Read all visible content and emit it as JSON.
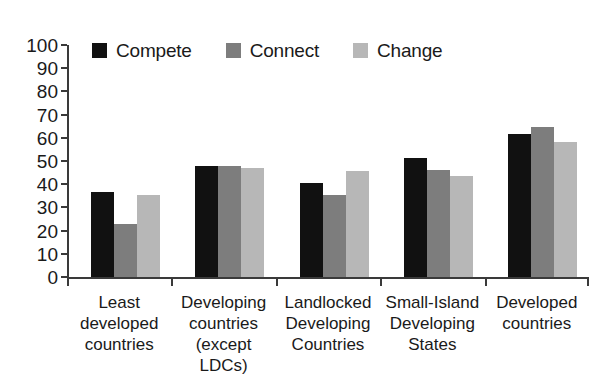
{
  "chart_data": {
    "type": "bar",
    "title": "",
    "xlabel": "",
    "ylabel": "",
    "ylim": [
      0,
      100
    ],
    "yticks": [
      0,
      10,
      20,
      30,
      40,
      50,
      60,
      70,
      80,
      90,
      100
    ],
    "grid": false,
    "legend_position": "top-left",
    "categories": [
      "Least developed countries",
      "Developing countries (except LDCs)",
      "Landlocked Developing Countries",
      "Small-Island Developing States",
      "Developed countries"
    ],
    "category_lines": [
      [
        "Least",
        "developed",
        "countries"
      ],
      [
        "Developing",
        "countries",
        "(except LDCs)"
      ],
      [
        "Landlocked",
        "Developing",
        "Countries"
      ],
      [
        "Small-Island",
        "Developing",
        "States"
      ],
      [
        "Developed",
        "countries"
      ]
    ],
    "series": [
      {
        "name": "Compete",
        "color": "#111111",
        "values": [
          36.5,
          48,
          40.5,
          51.5,
          61.5
        ]
      },
      {
        "name": "Connect",
        "color": "#7d7d7d",
        "values": [
          23,
          48,
          35.5,
          46,
          64.5
        ]
      },
      {
        "name": "Change",
        "color": "#b7b7b7",
        "values": [
          35.5,
          47,
          45.5,
          43.5,
          58
        ]
      }
    ]
  },
  "colors": {
    "axis": "#3a3a3a",
    "text": "#1a1a1a",
    "background": "#ffffff",
    "compete": "#111111",
    "connect": "#7d7d7d",
    "change": "#b7b7b7"
  }
}
